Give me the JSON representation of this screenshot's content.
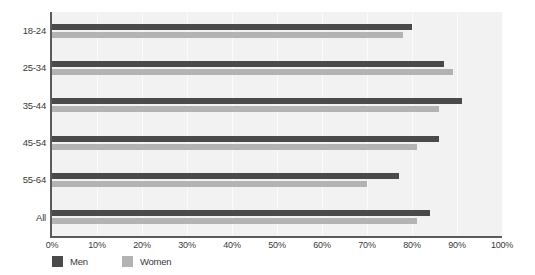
{
  "chart_data": {
    "type": "bar",
    "orientation": "horizontal",
    "title": "",
    "xlabel": "",
    "ylabel": "",
    "categories": [
      "18-24",
      "25-34",
      "35-44",
      "45-54",
      "55-64",
      "All"
    ],
    "series": [
      {
        "name": "Men",
        "color": "#4a4a4a",
        "values": [
          80,
          87,
          91,
          86,
          77,
          84
        ]
      },
      {
        "name": "Women",
        "color": "#b3b3b3",
        "values": [
          78,
          89,
          86,
          81,
          70,
          81
        ]
      }
    ],
    "xlim": [
      0,
      100
    ],
    "xticks": [
      0,
      10,
      20,
      30,
      40,
      50,
      60,
      70,
      80,
      90,
      100
    ],
    "xtick_labels": [
      "0%",
      "10%",
      "20%",
      "30%",
      "40%",
      "50%",
      "60%",
      "70%",
      "80%",
      "90%",
      "100%"
    ],
    "grid": true,
    "grid_axis": "x",
    "legend_position": "bottom-left",
    "legend": [
      "Men",
      "Women"
    ],
    "plot_background": "#f2f2f2",
    "axis_color": "#5b5b5b",
    "gridline_color": "#fbfbfb"
  }
}
